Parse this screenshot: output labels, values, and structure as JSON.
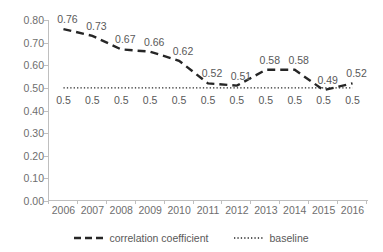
{
  "chart_data": {
    "type": "line",
    "title": "",
    "xlabel": "",
    "ylabel": "",
    "categories": [
      "2006",
      "2007",
      "2008",
      "2009",
      "2010",
      "2011",
      "2012",
      "2013",
      "2014",
      "2015",
      "2016"
    ],
    "ylim": [
      0.0,
      0.8
    ],
    "y_ticks": [
      "0.00",
      "0.10",
      "0.20",
      "0.30",
      "0.40",
      "0.50",
      "0.60",
      "0.70",
      "0.80"
    ],
    "y_tick_values": [
      0.0,
      0.1,
      0.2,
      0.3,
      0.4,
      0.5,
      0.6,
      0.7,
      0.8
    ],
    "grid": false,
    "legend_position": "bottom",
    "series": [
      {
        "name": "correlation coefficient",
        "style": "dashed",
        "color": "#262626",
        "values": [
          0.76,
          0.73,
          0.67,
          0.66,
          0.62,
          0.52,
          0.51,
          0.58,
          0.58,
          0.49,
          0.52
        ],
        "labels": [
          "0.76",
          "0.73",
          "0.67",
          "0.66",
          "0.62",
          "0.52",
          "0.51",
          "0.58",
          "0.58",
          "0.49",
          "0.52"
        ]
      },
      {
        "name": "baseline",
        "style": "dotted",
        "color": "#262626",
        "values": [
          0.5,
          0.5,
          0.5,
          0.5,
          0.5,
          0.5,
          0.5,
          0.5,
          0.5,
          0.5,
          0.5
        ],
        "labels": [
          "0.5",
          "0.5",
          "0.5",
          "0.5",
          "0.5",
          "0.5",
          "0.5",
          "0.5",
          "0.5",
          "0.5",
          "0.5"
        ]
      }
    ]
  },
  "legend": {
    "entries": [
      {
        "label": "correlation coefficient",
        "marker": "dashed-line-marker"
      },
      {
        "label": "baseline",
        "marker": "dotted-line-marker"
      }
    ]
  }
}
